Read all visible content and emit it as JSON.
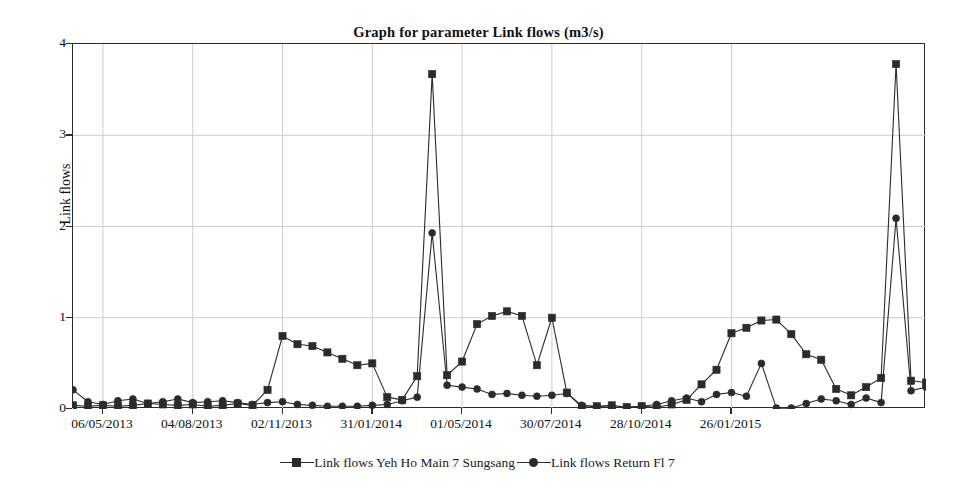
{
  "chart_data": {
    "type": "line",
    "title": "Graph for parameter Link flows (m3/s)",
    "xlabel": "",
    "ylabel": "Link flows",
    "ylim": [
      0,
      4
    ],
    "yticks": [
      0,
      1,
      2,
      3,
      4
    ],
    "grid": true,
    "legend_position": "bottom",
    "x_tick_labels": [
      "06/05/2013",
      "04/08/2013",
      "02/11/2013",
      "31/01/2014",
      "01/05/2014",
      "30/07/2014",
      "28/10/2014",
      "26/01/2015"
    ],
    "x_tick_indices": [
      2,
      8,
      14,
      20,
      26,
      32,
      38,
      44
    ],
    "n_points": 58,
    "series": [
      {
        "name": "Link flows Yeh Ho Main 7 Sungsang",
        "marker": "square",
        "color": "#2b2b2b",
        "values": [
          0.04,
          0.03,
          0.04,
          0.03,
          0.04,
          0.06,
          0.05,
          0.04,
          0.05,
          0.03,
          0.04,
          0.06,
          0.04,
          0.21,
          0.8,
          0.71,
          0.69,
          0.62,
          0.55,
          0.48,
          0.5,
          0.13,
          0.1,
          0.36,
          3.67,
          0.37,
          0.52,
          0.93,
          1.02,
          1.07,
          1.02,
          0.48,
          1.0,
          0.18,
          0.02,
          0.03,
          0.04,
          0.02,
          0.03,
          0.02,
          0.05,
          0.1,
          0.27,
          0.43,
          0.83,
          0.89,
          0.97,
          0.98,
          0.82,
          0.6,
          0.54,
          0.22,
          0.15,
          0.24,
          0.34,
          3.78,
          0.31,
          0.29,
          1.0,
          1.27,
          0.86,
          0.2,
          1.7,
          0.06
        ]
      },
      {
        "name": "Link flows Return Fl 7",
        "marker": "circle",
        "color": "#2b2b2b",
        "values": [
          0.21,
          0.08,
          0.05,
          0.09,
          0.11,
          0.06,
          0.08,
          0.11,
          0.07,
          0.08,
          0.09,
          0.07,
          0.05,
          0.07,
          0.08,
          0.05,
          0.04,
          0.03,
          0.03,
          0.03,
          0.04,
          0.05,
          0.09,
          0.13,
          1.93,
          0.26,
          0.24,
          0.22,
          0.16,
          0.17,
          0.15,
          0.14,
          0.15,
          0.17,
          0.04,
          0.03,
          0.02,
          0.02,
          0.03,
          0.05,
          0.09,
          0.12,
          0.08,
          0.16,
          0.18,
          0.14,
          0.5,
          0.01,
          0.01,
          0.06,
          0.11,
          0.09,
          0.05,
          0.12,
          0.07,
          2.09,
          0.2,
          0.24,
          0.26,
          0.23,
          0.18,
          0.12,
          0.34,
          0.17
        ]
      }
    ]
  },
  "legend": {
    "entries": [
      {
        "label": "Link flows Yeh Ho Main 7 Sungsang",
        "marker": "square"
      },
      {
        "label": "Link flows Return Fl 7",
        "marker": "circle"
      }
    ]
  },
  "axis": {
    "y_title": "Link flows"
  },
  "colors": {
    "line": "#2b2b2b",
    "grid": "#cccccc",
    "frame": "#2b2b2b",
    "background": "#ffffff"
  }
}
